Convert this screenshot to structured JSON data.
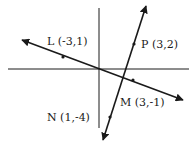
{
  "diagram": {
    "type": "coordinate-plane-lines",
    "points": [
      {
        "name": "L",
        "label": "L (-3,1)",
        "x": -3,
        "y": 1
      },
      {
        "name": "P",
        "label": "P (3,2)",
        "x": 3,
        "y": 2
      },
      {
        "name": "M",
        "label": "M (3,-1)",
        "x": 3,
        "y": -1
      },
      {
        "name": "N",
        "label": "N (1,-4)",
        "x": 1,
        "y": -4
      }
    ],
    "lines": [
      {
        "name": "line-LM",
        "through": [
          "L",
          "M"
        ]
      },
      {
        "name": "line-PN",
        "through": [
          "P",
          "N"
        ]
      }
    ],
    "colors": {
      "stroke": "#1a1a1a",
      "background": "#ffffff"
    }
  }
}
